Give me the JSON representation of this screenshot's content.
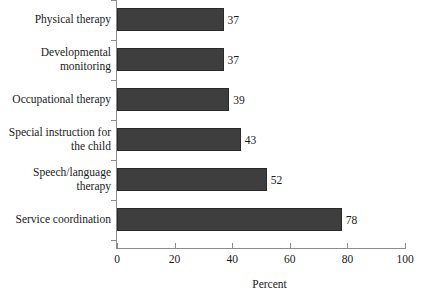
{
  "chart_data": {
    "type": "bar",
    "orientation": "horizontal",
    "title": "",
    "xlabel": "Percent",
    "ylabel": "",
    "xlim": [
      0,
      100
    ],
    "xticks": [
      0,
      20,
      40,
      60,
      80,
      100
    ],
    "grid": false,
    "legend": null,
    "categories": [
      "Physical therapy",
      "Developmental monitoring",
      "Occupational therapy",
      "Special instruction for the child",
      "Speech/language therapy",
      "Service coordination"
    ],
    "values": [
      37,
      37,
      39,
      43,
      52,
      78
    ],
    "value_labels": [
      "37",
      "37",
      "39",
      "43",
      "52",
      "78"
    ],
    "bar_color": "#3e3e3e",
    "bar_border_color": "#2a2a2a",
    "axis_color": "#8c8c8c",
    "background_color": "#ffffff"
  },
  "axis": {
    "tick_labels": [
      "0",
      "20",
      "40",
      "60",
      "80",
      "100"
    ],
    "title": "Percent"
  },
  "rows": [
    {
      "label": "Physical therapy",
      "value": "37"
    },
    {
      "label": "Developmental monitoring",
      "value": "37"
    },
    {
      "label": "Occupational therapy",
      "value": "39"
    },
    {
      "label": "Special instruction for the child",
      "value": "43"
    },
    {
      "label": "Speech/language therapy",
      "value": "52"
    },
    {
      "label": "Service coordination",
      "value": "78"
    }
  ]
}
